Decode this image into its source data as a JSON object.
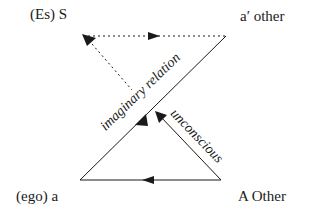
{
  "diagram": {
    "type": "Schema L",
    "nodes": [
      {
        "id": "S",
        "label": "(Es) S"
      },
      {
        "id": "a_prime",
        "label": "a′ other"
      },
      {
        "id": "a",
        "label": "(ego) a"
      },
      {
        "id": "A",
        "label": "A Other"
      }
    ],
    "edges": [
      {
        "from": "a_prime",
        "to": "S",
        "style": "dotted",
        "label": ""
      },
      {
        "from": "S",
        "to": "a_prime",
        "style": "dotted",
        "label": ""
      },
      {
        "from": "a_prime",
        "to": "a",
        "style": "solid",
        "label": "imaginary relation"
      },
      {
        "from": "A",
        "to": "a",
        "style": "solid",
        "label": ""
      },
      {
        "from": "A",
        "to": "S",
        "style": "solid-then-dotted",
        "label": "unconscious"
      }
    ],
    "edge_labels": {
      "imaginary": "imaginary relation",
      "unconscious": "unconscious"
    },
    "colors": {
      "ink": "#1a1a1a",
      "background": "#ffffff"
    }
  }
}
